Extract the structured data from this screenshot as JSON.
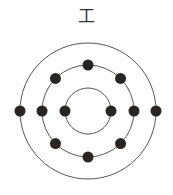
{
  "diagram": {
    "title": "工",
    "type": "bohr-atom-model",
    "center": [
      88,
      111
    ],
    "shells": [
      {
        "radius": 23,
        "electrons": 2,
        "angles_deg": [
          180,
          0
        ]
      },
      {
        "radius": 46,
        "electrons": 8,
        "angles_deg": [
          0,
          45,
          90,
          135,
          180,
          225,
          270,
          315
        ]
      },
      {
        "radius": 68,
        "electrons": 2,
        "angles_deg": [
          180,
          0
        ]
      }
    ],
    "colors": {
      "ring": "#555555",
      "electron": "#2a2424",
      "text": "#333333"
    }
  }
}
